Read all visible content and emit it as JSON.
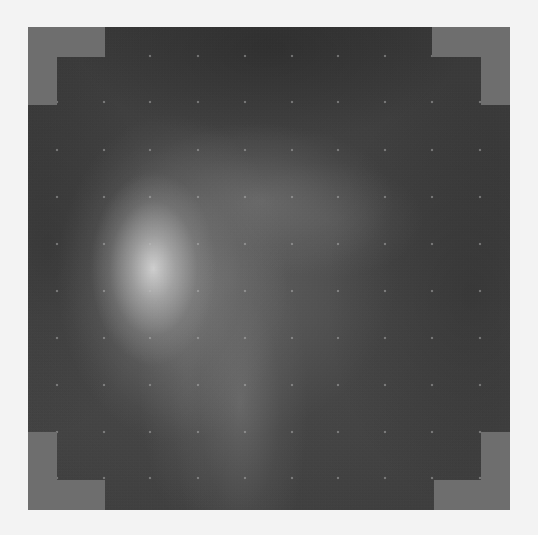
{
  "image": {
    "description": "Grayscale intensity map with stepped corner masks, bright blob at left-center and a regular grid of faint dots",
    "colors": {
      "background": "#f3f3f3",
      "mask_gray": "#6e6e6e",
      "dark_field": "#3e3e3e",
      "peak": "#d7d7d7"
    },
    "plot_rect": {
      "x": 28,
      "y": 27,
      "width": 482,
      "height": 483
    },
    "grid_dots": {
      "x": [
        29,
        76,
        122,
        170,
        217,
        264,
        310,
        357,
        404,
        452
      ],
      "y": [
        29,
        75,
        123,
        170,
        217,
        264,
        311,
        358,
        405,
        451
      ]
    },
    "corner_masks": [
      {
        "name": "top-left-outer",
        "x": 0,
        "y": 0,
        "w": 77,
        "h": 30
      },
      {
        "name": "top-left-inner",
        "x": 0,
        "y": 30,
        "w": 29,
        "h": 48
      },
      {
        "name": "top-right-outer",
        "x": 404,
        "y": 0,
        "w": 78,
        "h": 30
      },
      {
        "name": "top-right-inner",
        "x": 453,
        "y": 30,
        "w": 29,
        "h": 48
      },
      {
        "name": "bottom-left-inner",
        "x": 0,
        "y": 405,
        "w": 29,
        "h": 48
      },
      {
        "name": "bottom-left-outer",
        "x": 0,
        "y": 453,
        "w": 77,
        "h": 30
      },
      {
        "name": "bottom-right-inner",
        "x": 453,
        "y": 405,
        "w": 29,
        "h": 48
      },
      {
        "name": "bottom-right-outer",
        "x": 406,
        "y": 453,
        "w": 76,
        "h": 30
      }
    ]
  }
}
